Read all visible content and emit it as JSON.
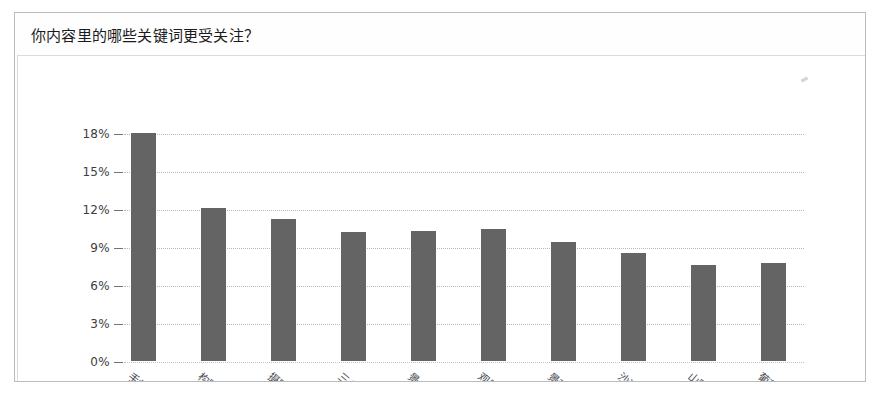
{
  "card": {
    "title": "你内容里的哪些关键词更受关注？"
  },
  "chart_data": {
    "type": "bar",
    "title": "你内容里的哪些关键词更受关注？",
    "xlabel": "",
    "ylabel": "",
    "ylim": [
      0,
      18
    ],
    "yticks": [
      "0%",
      "3%",
      "6%",
      "9%",
      "12%",
      "15%",
      "18%"
    ],
    "ytick_values": [
      0,
      3,
      6,
      9,
      12,
      15,
      18
    ],
    "grid": true,
    "legend": false,
    "bar_color": "#646464",
    "categories": [
      "手机",
      "构图法",
      "摄影师",
      "三分线",
      "景点",
      "观景台",
      "景观",
      "沙漠",
      "山脉",
      "葡萄"
    ],
    "values": [
      18.0,
      12.1,
      11.2,
      10.2,
      10.3,
      10.4,
      9.4,
      8.5,
      7.6,
      7.7
    ],
    "value_labels": [
      "18%",
      "12.1%",
      "11.2%",
      "10.2%",
      "10.3%",
      "10.4%",
      "9.4%",
      "8.5%",
      "7.6%",
      "7.7%"
    ]
  },
  "colors": {
    "bar": "#646464",
    "grid": "#b4b9c2",
    "card_border": "#b9bcc0",
    "text": "#1b1b1b"
  }
}
